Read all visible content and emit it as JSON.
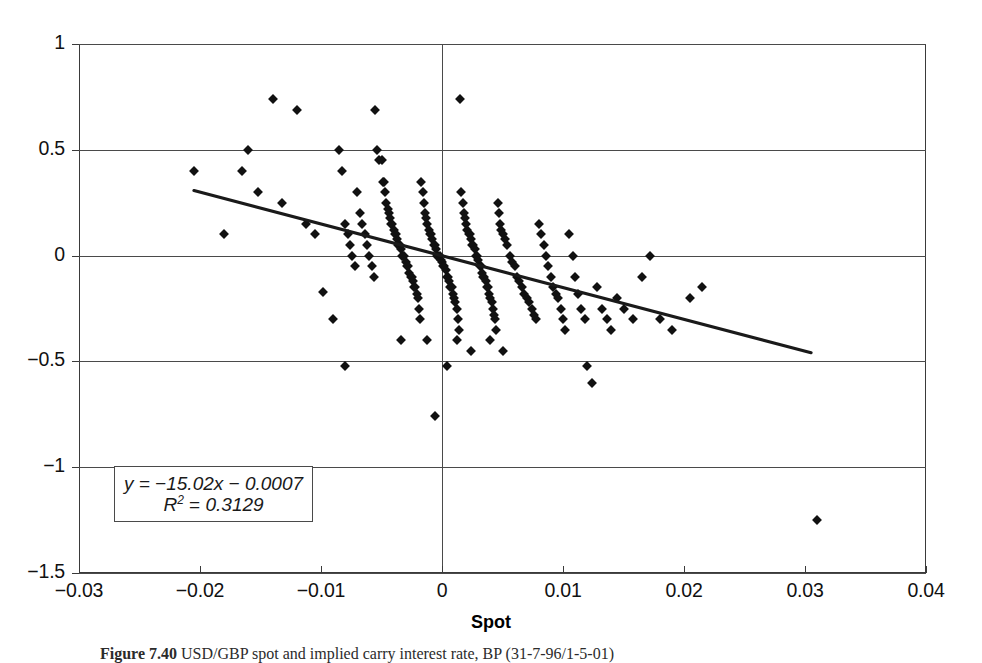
{
  "figure": {
    "caption_label": "Figure 7.40",
    "caption_text": "USD/GBP spot and implied carry interest rate, BP (31-7-96/1-5-01)"
  },
  "axis_title_x": "Spot",
  "equation": {
    "line1_prefix": "y",
    "line1": "y = −15.02x − 0.0007",
    "line2": "R² = 0.3129",
    "slope": -15.02,
    "intercept": -0.0007,
    "r_squared": 0.3129
  },
  "chart_data": {
    "type": "scatter",
    "title": "",
    "xlabel": "Spot",
    "ylabel": "",
    "xlim": [
      -0.03,
      0.04
    ],
    "ylim": [
      -1.5,
      1.0
    ],
    "xticks": [
      -0.03,
      -0.02,
      -0.01,
      0,
      0.01,
      0.02,
      0.03,
      0.04
    ],
    "xticklabels": [
      "−0.03",
      "−0.02",
      "−0.01",
      "0",
      "0.01",
      "0.02",
      "0.03",
      "0.04"
    ],
    "yticks": [
      1,
      0.5,
      0,
      -0.5,
      -1,
      -1.5
    ],
    "yticklabels": [
      "1",
      "0.5",
      "0",
      "−0.5",
      "−1",
      "−1.5"
    ],
    "grid": "horizontal gridlines at every y tick; vertical line at x = 0",
    "legend": "none",
    "marker": "filled black diamond",
    "trendline": {
      "type": "linear",
      "equation": "y = −15.02x − 0.0007",
      "r_squared": 0.3129,
      "x_start": -0.0205,
      "y_start": 0.3073,
      "x_end": 0.0305,
      "y_end": -0.4588
    },
    "points": [
      [
        -0.0205,
        0.4
      ],
      [
        -0.018,
        0.1
      ],
      [
        -0.0165,
        0.4
      ],
      [
        -0.016,
        0.5
      ],
      [
        -0.0152,
        0.3
      ],
      [
        -0.014,
        0.74
      ],
      [
        -0.0132,
        0.25
      ],
      [
        -0.012,
        0.69
      ],
      [
        -0.0112,
        0.15
      ],
      [
        -0.0105,
        0.1
      ],
      [
        -0.0098,
        -0.17
      ],
      [
        -0.009,
        -0.3
      ],
      [
        -0.0085,
        0.5
      ],
      [
        -0.0083,
        0.4
      ],
      [
        -0.008,
        0.15
      ],
      [
        -0.0078,
        0.1
      ],
      [
        -0.0076,
        0.05
      ],
      [
        -0.0074,
        0.0
      ],
      [
        -0.0072,
        -0.05
      ],
      [
        -0.007,
        0.3
      ],
      [
        -0.0068,
        0.2
      ],
      [
        -0.0066,
        0.15
      ],
      [
        -0.0064,
        0.1
      ],
      [
        -0.0062,
        0.05
      ],
      [
        -0.006,
        0.0
      ],
      [
        -0.0058,
        -0.05
      ],
      [
        -0.0056,
        -0.1
      ],
      [
        -0.0055,
        0.69
      ],
      [
        -0.0054,
        0.5
      ],
      [
        -0.0052,
        0.45
      ],
      [
        -0.005,
        0.45
      ],
      [
        -0.0049,
        0.35
      ],
      [
        -0.0048,
        0.35
      ],
      [
        -0.0047,
        0.3
      ],
      [
        -0.0046,
        0.25
      ],
      [
        -0.0045,
        0.22
      ],
      [
        -0.0044,
        0.2
      ],
      [
        -0.0043,
        0.18
      ],
      [
        -0.0042,
        0.15
      ],
      [
        -0.0041,
        0.15
      ],
      [
        -0.004,
        0.12
      ],
      [
        -0.0039,
        0.1
      ],
      [
        -0.0038,
        0.1
      ],
      [
        -0.0037,
        0.08
      ],
      [
        -0.0036,
        0.05
      ],
      [
        -0.0035,
        0.05
      ],
      [
        -0.0034,
        0.03
      ],
      [
        -0.0033,
        0.0
      ],
      [
        -0.0032,
        0.0
      ],
      [
        -0.0031,
        0.0
      ],
      [
        -0.003,
        -0.03
      ],
      [
        -0.0029,
        -0.05
      ],
      [
        -0.0028,
        -0.05
      ],
      [
        -0.0027,
        -0.08
      ],
      [
        -0.0026,
        -0.1
      ],
      [
        -0.0025,
        -0.1
      ],
      [
        -0.0024,
        -0.12
      ],
      [
        -0.0023,
        -0.15
      ],
      [
        -0.0022,
        -0.15
      ],
      [
        -0.0021,
        -0.18
      ],
      [
        -0.002,
        -0.2
      ],
      [
        -0.0019,
        -0.25
      ],
      [
        -0.0018,
        -0.3
      ],
      [
        -0.0017,
        0.35
      ],
      [
        -0.0016,
        0.3
      ],
      [
        -0.0015,
        0.25
      ],
      [
        -0.0014,
        0.2
      ],
      [
        -0.0013,
        0.18
      ],
      [
        -0.0012,
        0.15
      ],
      [
        -0.0011,
        0.12
      ],
      [
        -0.001,
        0.1
      ],
      [
        -0.0009,
        0.1
      ],
      [
        -0.0008,
        0.08
      ],
      [
        -0.0007,
        0.05
      ],
      [
        -0.0006,
        0.05
      ],
      [
        -0.0005,
        0.03
      ],
      [
        -0.0004,
        0.0
      ],
      [
        -0.0003,
        0.0
      ],
      [
        -0.0002,
        0.0
      ],
      [
        -0.0001,
        -0.02
      ],
      [
        0.0,
        -0.03
      ],
      [
        0.0001,
        -0.05
      ],
      [
        0.0002,
        -0.05
      ],
      [
        0.0003,
        -0.07
      ],
      [
        0.0004,
        -0.1
      ],
      [
        0.0005,
        -0.1
      ],
      [
        0.0006,
        -0.12
      ],
      [
        0.0007,
        -0.15
      ],
      [
        0.0008,
        -0.15
      ],
      [
        0.0009,
        -0.18
      ],
      [
        0.001,
        -0.2
      ],
      [
        0.0011,
        -0.22
      ],
      [
        0.0012,
        -0.25
      ],
      [
        0.0013,
        -0.3
      ],
      [
        0.0014,
        -0.35
      ],
      [
        0.0015,
        0.74
      ],
      [
        0.0016,
        0.3
      ],
      [
        0.0017,
        0.25
      ],
      [
        0.0018,
        0.2
      ],
      [
        0.0019,
        0.18
      ],
      [
        0.002,
        0.15
      ],
      [
        0.0021,
        0.12
      ],
      [
        0.0022,
        0.1
      ],
      [
        0.0023,
        0.1
      ],
      [
        0.0024,
        0.08
      ],
      [
        0.0025,
        0.05
      ],
      [
        0.0026,
        0.05
      ],
      [
        0.0027,
        0.03
      ],
      [
        0.0028,
        0.0
      ],
      [
        0.0029,
        0.0
      ],
      [
        0.003,
        -0.02
      ],
      [
        0.0031,
        -0.05
      ],
      [
        0.0032,
        -0.05
      ],
      [
        0.0033,
        -0.08
      ],
      [
        0.0034,
        -0.1
      ],
      [
        0.0035,
        -0.1
      ],
      [
        0.0036,
        -0.12
      ],
      [
        0.0037,
        -0.15
      ],
      [
        0.0038,
        -0.15
      ],
      [
        0.0039,
        -0.18
      ],
      [
        0.004,
        -0.2
      ],
      [
        0.0041,
        -0.22
      ],
      [
        0.0042,
        -0.25
      ],
      [
        0.0043,
        -0.28
      ],
      [
        0.0044,
        -0.3
      ],
      [
        0.0045,
        -0.35
      ],
      [
        0.0046,
        0.25
      ],
      [
        0.0047,
        0.2
      ],
      [
        0.0048,
        0.15
      ],
      [
        0.0049,
        0.12
      ],
      [
        0.005,
        0.1
      ],
      [
        0.0052,
        0.08
      ],
      [
        0.0054,
        0.05
      ],
      [
        0.0056,
        0.0
      ],
      [
        0.0058,
        -0.03
      ],
      [
        0.006,
        -0.05
      ],
      [
        0.0062,
        -0.1
      ],
      [
        0.0064,
        -0.12
      ],
      [
        0.0066,
        -0.15
      ],
      [
        0.0068,
        -0.18
      ],
      [
        0.007,
        -0.2
      ],
      [
        0.0072,
        -0.22
      ],
      [
        0.0074,
        -0.25
      ],
      [
        0.0076,
        -0.28
      ],
      [
        0.0078,
        -0.3
      ],
      [
        0.008,
        0.15
      ],
      [
        0.0082,
        0.1
      ],
      [
        0.0084,
        0.05
      ],
      [
        0.0086,
        0.0
      ],
      [
        0.0088,
        -0.05
      ],
      [
        0.009,
        -0.1
      ],
      [
        0.0092,
        -0.15
      ],
      [
        0.0094,
        -0.18
      ],
      [
        0.0096,
        -0.2
      ],
      [
        0.0098,
        -0.25
      ],
      [
        0.01,
        -0.3
      ],
      [
        0.0102,
        -0.35
      ],
      [
        0.0105,
        0.1
      ],
      [
        0.0108,
        0.0
      ],
      [
        0.011,
        -0.1
      ],
      [
        0.0112,
        -0.18
      ],
      [
        0.0115,
        -0.25
      ],
      [
        0.0118,
        -0.3
      ],
      [
        0.012,
        -0.52
      ],
      [
        0.0124,
        -0.6
      ],
      [
        0.0128,
        -0.15
      ],
      [
        0.0132,
        -0.25
      ],
      [
        0.0136,
        -0.3
      ],
      [
        0.014,
        -0.35
      ],
      [
        0.0145,
        -0.2
      ],
      [
        0.015,
        -0.25
      ],
      [
        0.0158,
        -0.3
      ],
      [
        0.0165,
        -0.1
      ],
      [
        0.0172,
        0.0
      ],
      [
        0.018,
        -0.3
      ],
      [
        0.019,
        -0.35
      ],
      [
        0.0205,
        -0.2
      ],
      [
        0.0215,
        -0.15
      ],
      [
        0.031,
        -1.25
      ],
      [
        -0.0006,
        -0.76
      ],
      [
        -0.008,
        -0.52
      ],
      [
        0.0004,
        -0.52
      ],
      [
        0.0024,
        -0.45
      ],
      [
        0.005,
        -0.45
      ],
      [
        -0.0034,
        -0.4
      ],
      [
        -0.0012,
        -0.4
      ],
      [
        0.0012,
        -0.4
      ],
      [
        0.004,
        -0.4
      ]
    ]
  }
}
